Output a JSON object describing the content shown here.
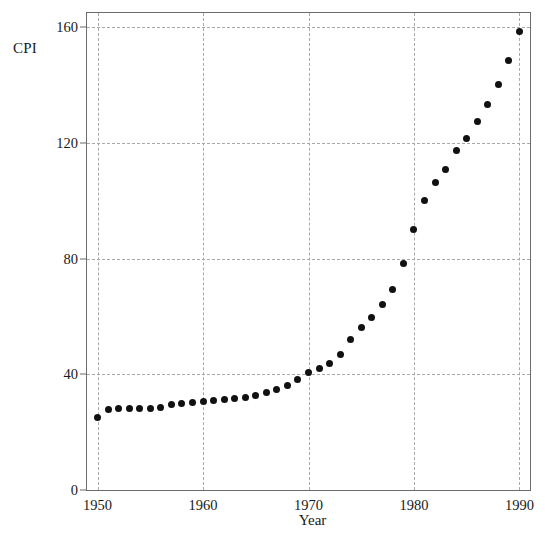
{
  "chart_data": {
    "type": "scatter",
    "title": "",
    "xlabel": "Year",
    "ylabel": "CPI",
    "xlim": [
      1949,
      1991
    ],
    "ylim": [
      0,
      165
    ],
    "grid": true,
    "legend": null,
    "xticks": [
      1950,
      1960,
      1970,
      1980,
      1990
    ],
    "xticklabels": [
      "1950",
      "1960",
      "1970",
      "1980",
      "1990"
    ],
    "yticks": [
      0,
      40,
      80,
      120,
      160
    ],
    "yticklabels": [
      "0",
      "40",
      "80",
      "120",
      "160"
    ],
    "marker": "filled-circle",
    "marker_color": "#111111",
    "grid_color": "#a9a9a9",
    "frame_color": "#6b6b6b",
    "x": [
      1950,
      1951,
      1952,
      1953,
      1954,
      1955,
      1956,
      1957,
      1958,
      1959,
      1960,
      1961,
      1962,
      1963,
      1964,
      1965,
      1966,
      1967,
      1968,
      1969,
      1970,
      1971,
      1972,
      1973,
      1974,
      1975,
      1976,
      1977,
      1978,
      1979,
      1980,
      1981,
      1982,
      1983,
      1984,
      1985,
      1986,
      1987,
      1988,
      1989,
      1990
    ],
    "values": [
      25.0,
      27.8,
      28.2,
      28.2,
      28.3,
      28.2,
      28.5,
      29.5,
      30.0,
      30.2,
      30.7,
      30.9,
      31.3,
      31.6,
      32.1,
      32.7,
      33.7,
      34.7,
      36.2,
      38.1,
      40.5,
      41.9,
      43.6,
      47.0,
      52.1,
      56.2,
      59.6,
      64.0,
      69.3,
      78.5,
      90.2,
      100.0,
      106.4,
      111.0,
      117.4,
      121.5,
      127.3,
      133.5,
      140.1,
      148.5,
      158.6
    ]
  }
}
